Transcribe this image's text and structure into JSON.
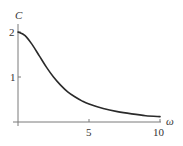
{
  "chart_data": {
    "type": "line",
    "title": "",
    "xlabel": "ω",
    "ylabel": "C",
    "xlim": [
      0,
      10
    ],
    "ylim": [
      0,
      2.2
    ],
    "x_ticks": [
      0,
      5,
      10
    ],
    "x_tick_labels": [
      "",
      "5",
      "10"
    ],
    "y_ticks": [
      1,
      2
    ],
    "y_tick_labels": [
      "1",
      "2"
    ],
    "grid": false,
    "legend": null,
    "series": [
      {
        "name": "C(ω)",
        "x": [
          0,
          0.5,
          1,
          1.5,
          2,
          2.5,
          3,
          3.5,
          4,
          4.5,
          5,
          6,
          7,
          8,
          9,
          10
        ],
        "values": [
          2.0,
          1.92,
          1.72,
          1.47,
          1.22,
          1.0,
          0.82,
          0.67,
          0.56,
          0.47,
          0.4,
          0.3,
          0.23,
          0.18,
          0.14,
          0.12
        ]
      }
    ],
    "colors": {
      "curve": "#2a2a2a",
      "axis": "#7a7a7a"
    }
  },
  "labels": {
    "y_axis_title": "C",
    "x_axis_title": "ω",
    "y_tick_1": "1",
    "y_tick_2": "2",
    "x_tick_5": "5",
    "x_tick_10": "10"
  }
}
